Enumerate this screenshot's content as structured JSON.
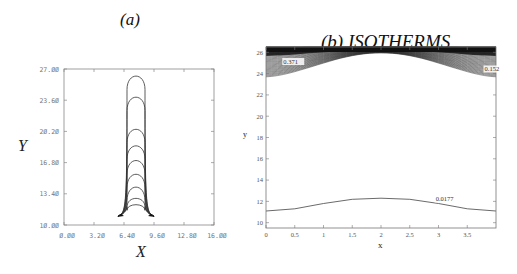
{
  "chart_data": [
    {
      "id": "a",
      "type": "line",
      "title": "(a)",
      "xlabel": "X",
      "ylabel": "Y",
      "xlim": [
        0.0,
        16.0
      ],
      "ylim": [
        10.0,
        27.0
      ],
      "xticks": [
        "0.00",
        "3.20",
        "6.40",
        "9.60",
        "12.80",
        "16.00"
      ],
      "yticks": [
        "10.00",
        "13.40",
        "16.80",
        "20.20",
        "23.60",
        "27.00"
      ],
      "grid": false,
      "description": "Nested arch-shaped interface profiles rising from a flared base near Y=11",
      "series": [
        {
          "name": "profile-1",
          "apex_y": 26.5
        },
        {
          "name": "profile-2",
          "apex_y": 24.2
        },
        {
          "name": "profile-3",
          "apex_y": 20.7
        },
        {
          "name": "profile-4",
          "apex_y": 18.9
        },
        {
          "name": "profile-5",
          "apex_y": 17.3
        },
        {
          "name": "profile-6",
          "apex_y": 15.8
        },
        {
          "name": "profile-7",
          "apex_y": 14.4
        },
        {
          "name": "profile-8",
          "apex_y": 13.0
        },
        {
          "name": "profile-9",
          "apex_y": 12.2
        }
      ],
      "tube_x_range": [
        6.0,
        8.8
      ],
      "base_y": 11.1
    },
    {
      "id": "b",
      "type": "line",
      "title": "(b) ISOTHERMS",
      "xlabel": "x",
      "ylabel": "y",
      "xlim": [
        0,
        4
      ],
      "ylim": [
        9.5,
        26.5
      ],
      "xticks": [
        "0",
        "0.5",
        "1",
        "1.5",
        "2",
        "2.5",
        "3",
        "3.5"
      ],
      "yticks": [
        "10",
        "12",
        "14",
        "16",
        "18",
        "20",
        "22",
        "24",
        "26"
      ],
      "grid": false,
      "contour_labels": [
        {
          "text": "0.371",
          "x": 0.3,
          "y": 24.9
        },
        {
          "text": "0.152",
          "x": 3.8,
          "y": 24.2
        },
        {
          "text": "0.0177",
          "x": 2.95,
          "y": 12.0
        }
      ],
      "series": [
        {
          "name": "isotherm-0.0177",
          "x": [
            0,
            0.5,
            1,
            1.5,
            2,
            2.5,
            3,
            3.5,
            4
          ],
          "y": [
            11.1,
            11.3,
            11.8,
            12.2,
            12.3,
            12.2,
            11.8,
            11.3,
            11.1
          ]
        },
        {
          "name": "isotherm-dense-band",
          "description": "dense isotherms clustered near top boundary, dipping to y≈23.8 at x=0 and x=4, hugging y≈26 at x=2"
        }
      ]
    }
  ],
  "panels": {
    "a": {
      "title": "(a)",
      "xlabel": "X",
      "ylabel": "Y"
    },
    "b": {
      "title": "(b) ISOTHERMS",
      "xlabel": "x",
      "ylabel": "y"
    }
  }
}
